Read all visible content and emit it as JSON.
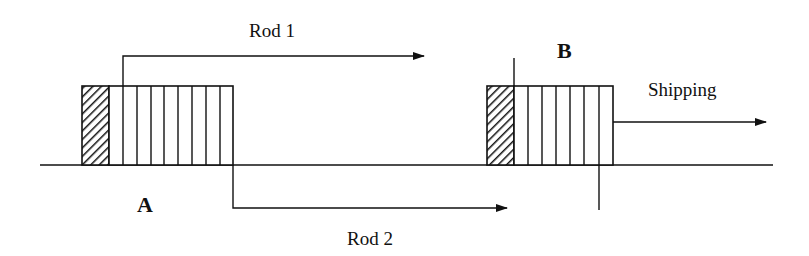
{
  "diagram": {
    "title": "",
    "colors": {
      "ink": "#111111",
      "background": "#ffffff"
    },
    "labels": {
      "rod1": "Rod 1",
      "rod2": "Rod 2",
      "shipping": "Shipping",
      "point_a": "A",
      "point_b": "B"
    },
    "boxes": [
      {
        "id": "A",
        "hatched_cells": 1,
        "plain_cells": 8
      },
      {
        "id": "B",
        "hatched_cells": 1,
        "plain_cells": 7
      }
    ],
    "arrows": [
      {
        "id": "rod1",
        "label": "Rod 1",
        "direction": "right"
      },
      {
        "id": "rod2",
        "label": "Rod 2",
        "direction": "right"
      },
      {
        "id": "shipping",
        "label": "Shipping",
        "direction": "right"
      }
    ]
  }
}
